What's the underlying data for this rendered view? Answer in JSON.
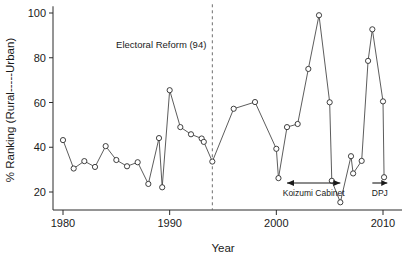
{
  "chart_data": {
    "type": "line",
    "title": "",
    "xlabel": "Year",
    "ylabel": "% Ranking (Rural-----Urban)",
    "xlim": [
      1979,
      2010.5
    ],
    "ylim": [
      13,
      103
    ],
    "grid": false,
    "legend": "none",
    "markers": "open-circle",
    "x": [
      1980,
      1981,
      1982,
      1983,
      1984,
      1985,
      1986,
      1987,
      1988,
      1989,
      1989,
      1990,
      1991,
      1992,
      1993,
      1993,
      1994,
      1996,
      1998,
      2000,
      2000,
      2001,
      2002,
      2003,
      2004,
      2005,
      2005,
      2006,
      2007,
      2007,
      2008,
      2009,
      2010,
      2010
    ],
    "values": [
      43.2,
      30.5,
      33.8,
      31.2,
      40.5,
      34.3,
      31.5,
      33.3,
      23.6,
      44.1,
      22.1,
      65.5,
      49.0,
      45.8,
      43.9,
      42.4,
      33.6,
      57.2,
      60.2,
      39.3,
      26.2,
      49.0,
      50.4,
      75.0,
      99.0,
      60.1,
      25.0,
      15.4,
      36.0,
      28.3,
      78.6,
      92.7,
      60.5,
      26.6
    ],
    "series": [
      {
        "name": "% Ranking (Rural-Urban)",
        "points": [
          {
            "year": 1980,
            "value": 43.2
          },
          {
            "year": 1981,
            "value": 30.5
          },
          {
            "year": 1982,
            "value": 33.8
          },
          {
            "year": 1983,
            "value": 31.2
          },
          {
            "year": 1984,
            "value": 40.5
          },
          {
            "year": 1985,
            "value": 34.3
          },
          {
            "year": 1986,
            "value": 31.5
          },
          {
            "year": 1987,
            "value": 33.3
          },
          {
            "year": 1988,
            "value": 23.6
          },
          {
            "year": 1989,
            "value": 44.1
          },
          {
            "year": 1989.3,
            "value": 22.1
          },
          {
            "year": 1990,
            "value": 65.5
          },
          {
            "year": 1991,
            "value": 49.0
          },
          {
            "year": 1992,
            "value": 45.8
          },
          {
            "year": 1993,
            "value": 43.9
          },
          {
            "year": 1993.2,
            "value": 42.4
          },
          {
            "year": 1994,
            "value": 33.6
          },
          {
            "year": 1996,
            "value": 57.2
          },
          {
            "year": 1998,
            "value": 60.2
          },
          {
            "year": 2000,
            "value": 39.3
          },
          {
            "year": 2000.2,
            "value": 26.2
          },
          {
            "year": 2001,
            "value": 49.0
          },
          {
            "year": 2002,
            "value": 50.4
          },
          {
            "year": 2003,
            "value": 75.0
          },
          {
            "year": 2004,
            "value": 99.0
          },
          {
            "year": 2005,
            "value": 60.1
          },
          {
            "year": 2005.2,
            "value": 25.0
          },
          {
            "year": 2006,
            "value": 15.4
          },
          {
            "year": 2007,
            "value": 36.0
          },
          {
            "year": 2007.2,
            "value": 28.3
          },
          {
            "year": 2008,
            "value": 33.9
          },
          {
            "year": 2008.6,
            "value": 78.6
          },
          {
            "year": 2009,
            "value": 92.7
          },
          {
            "year": 2010,
            "value": 60.5
          },
          {
            "year": 2010.1,
            "value": 26.6
          }
        ]
      }
    ],
    "xticks": [
      1980,
      1990,
      2000,
      2010
    ],
    "xtick_labels": [
      "1980",
      "1990",
      "2000",
      "2010"
    ],
    "yticks": [
      20,
      40,
      60,
      80,
      100
    ],
    "ytick_labels": [
      "20",
      "40",
      "60",
      "80",
      "100"
    ],
    "annotations": [
      {
        "id": "electoral-reform",
        "label": "Electoral Reform (94)",
        "type": "vline-label",
        "x": 1994
      },
      {
        "id": "koizumi-cabinet",
        "label": "Koizumi Cabinet",
        "type": "span-arrow",
        "x_start": 2001,
        "x_end": 2006
      },
      {
        "id": "dpj",
        "label": "DPJ",
        "type": "open-arrow",
        "x_start": 2009,
        "x_end": 2010.4
      }
    ],
    "colors": {
      "line": "#4a4a4a",
      "marker_fill": "#ffffff",
      "marker_stroke": "#2b2b2b",
      "axis": "#2b2b2b",
      "reference_line": "#6e6e6e",
      "text": "#1a1a1a",
      "background": "#ffffff"
    }
  }
}
